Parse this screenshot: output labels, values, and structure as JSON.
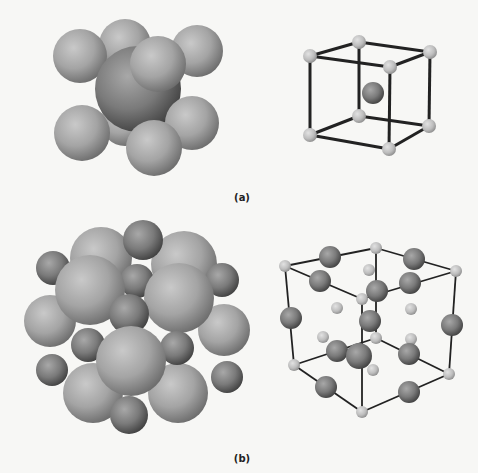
{
  "figure": {
    "panels": [
      {
        "label": "(a)",
        "structure": "body-centered cubic",
        "views": [
          "space-filling sphere model",
          "ball-and-stick unit cell"
        ],
        "atoms": {
          "corner": 8,
          "center": 1
        }
      },
      {
        "label": "(b)",
        "structure": "rock-salt (NaCl-type) cubic",
        "views": [
          "space-filling sphere model",
          "ball-and-stick unit cell"
        ],
        "atoms": {
          "large_edge_and_center": "dark large spheres",
          "small_corner_and_face": "light small spheres"
        }
      }
    ],
    "colors": {
      "background": "#f7f7f5",
      "sphere_light": "#c4c4c4",
      "sphere_mid": "#9a9a9a",
      "sphere_dark": "#5a5a5a",
      "bond": "#222222"
    }
  }
}
